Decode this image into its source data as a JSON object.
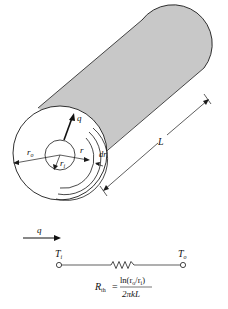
{
  "diagram": {
    "colors": {
      "cylinder_fill": "#c8c8c8",
      "stroke": "#1a1a1a",
      "background": "#ffffff"
    },
    "cylinder": {
      "labels": {
        "q": "q",
        "r_o": "r",
        "r_o_sub": "o",
        "r_i": "r",
        "r_i_sub": "i",
        "r": "r",
        "dr": "dr",
        "L": "L"
      }
    },
    "circuit": {
      "heat_flow_label": "q",
      "left_node": "T",
      "left_node_sub": "i",
      "right_node": "T",
      "right_node_sub": "o",
      "resistance_symbol": "R",
      "resistance_sub": "th",
      "equals": "=",
      "numerator": "ln(r",
      "numerator_sub1": "o",
      "numerator_mid": "/r",
      "numerator_sub2": "i",
      "numerator_end": ")",
      "denominator": "2πkL"
    }
  }
}
